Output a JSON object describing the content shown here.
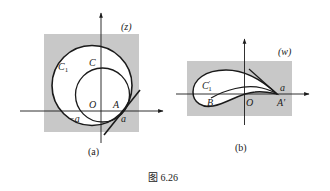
{
  "figure": {
    "caption": "图 6.26",
    "colors": {
      "background": "#ffffff",
      "shade": "#c8c8c8",
      "curve": "#1a1a1a",
      "fill_inside": "#ffffff"
    }
  },
  "panel_a": {
    "plane_label": "(z)",
    "sublabel": "(a)",
    "labels": {
      "outer_circle": "C",
      "outer_circle_sub": "1",
      "inner_circle": "C",
      "origin": "O",
      "point": "A",
      "neg_a": "−a",
      "pos_a": "a"
    }
  },
  "panel_b": {
    "plane_label": "(w)",
    "sublabel": "(b)",
    "labels": {
      "profile": "C",
      "profile_prime": "′",
      "profile_sub": "1",
      "leading_point": "B",
      "origin": "O",
      "trailing_point": "A′",
      "pos_a": "a"
    }
  }
}
